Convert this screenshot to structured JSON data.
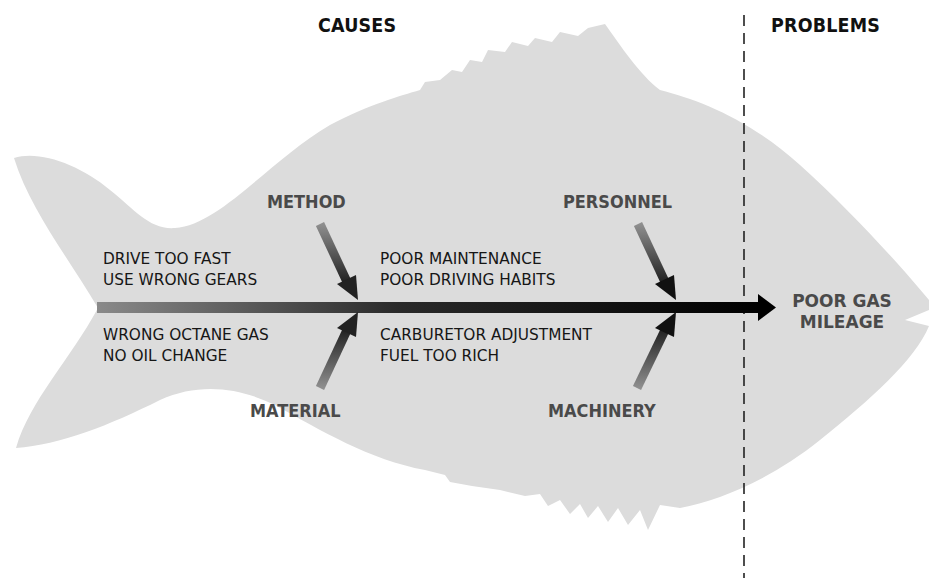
{
  "headers": {
    "causes": "CAUSES",
    "problems": "PROBLEMS"
  },
  "categories": {
    "method": "METHOD",
    "personnel": "PERSONNEL",
    "material": "MATERIAL",
    "machinery": "MACHINERY"
  },
  "causes": {
    "method": [
      "DRIVE TOO FAST",
      "USE WRONG GEARS"
    ],
    "personnel": [
      "POOR MAINTENANCE",
      "POOR DRIVING HABITS"
    ],
    "material": [
      "WRONG OCTANE GAS",
      "NO OIL CHANGE"
    ],
    "machinery": [
      "CARBURETOR ADJUSTMENT",
      "FUEL TOO RICH"
    ]
  },
  "problem": [
    "POOR GAS",
    "MILEAGE"
  ],
  "colors": {
    "fish_fill": "#dcdcdc",
    "spine_start": "#8a8a8a",
    "spine_end": "#000000",
    "category_text": "#4a4a4a",
    "header_text": "#111111",
    "divider": "#222222"
  }
}
